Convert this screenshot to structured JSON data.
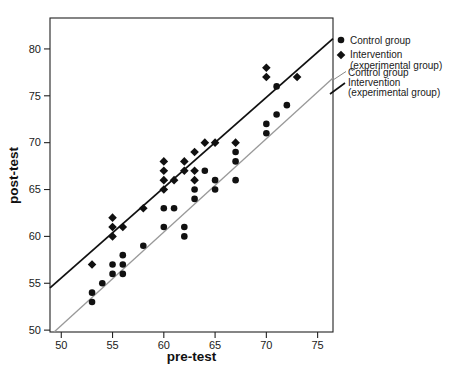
{
  "chart_data": {
    "type": "scatter",
    "title": "",
    "xlabel": "pre-test",
    "ylabel": "post-test",
    "xlim": [
      48.9,
      76.5
    ],
    "ylim": [
      49.8,
      83.3
    ],
    "x_ticks": [
      50,
      55,
      60,
      65,
      70,
      75
    ],
    "y_ticks": [
      50,
      55,
      60,
      65,
      70,
      75,
      80
    ],
    "grid": false,
    "legend_position": "right-outside",
    "colors": {
      "marker": "#111111",
      "control_line": "#999999",
      "intervention_line": "#111111",
      "spine": "#222222"
    },
    "series": [
      {
        "name": "Control group",
        "marker": "circle",
        "color": "#111111",
        "points": [
          [
            53,
            53
          ],
          [
            53,
            54
          ],
          [
            54,
            55
          ],
          [
            55,
            56
          ],
          [
            55,
            57
          ],
          [
            56,
            56
          ],
          [
            56,
            57
          ],
          [
            56,
            58
          ],
          [
            58,
            59
          ],
          [
            60,
            61
          ],
          [
            60,
            63
          ],
          [
            61,
            63
          ],
          [
            62,
            60
          ],
          [
            62,
            61
          ],
          [
            63,
            64
          ],
          [
            63,
            65
          ],
          [
            64,
            67
          ],
          [
            65,
            65
          ],
          [
            65,
            66
          ],
          [
            67,
            66
          ],
          [
            67,
            68
          ],
          [
            67,
            69
          ],
          [
            70,
            71
          ],
          [
            70,
            72
          ],
          [
            71,
            73
          ],
          [
            71,
            76
          ],
          [
            72,
            74
          ]
        ]
      },
      {
        "name": "Intervention (experimental group)",
        "marker": "diamond",
        "color": "#111111",
        "points": [
          [
            53,
            57
          ],
          [
            55,
            60
          ],
          [
            55,
            61
          ],
          [
            55,
            62
          ],
          [
            56,
            61
          ],
          [
            58,
            63
          ],
          [
            60,
            65
          ],
          [
            60,
            66
          ],
          [
            60,
            67
          ],
          [
            60,
            68
          ],
          [
            61,
            66
          ],
          [
            62,
            67
          ],
          [
            62,
            68
          ],
          [
            63,
            66
          ],
          [
            63,
            67
          ],
          [
            63,
            69
          ],
          [
            64,
            70
          ],
          [
            65,
            70
          ],
          [
            67,
            70
          ],
          [
            70,
            77
          ],
          [
            70,
            78
          ],
          [
            73,
            77
          ]
        ]
      }
    ],
    "fit_lines": [
      {
        "name": "Control group",
        "style": "thin-gray",
        "color": "#999999",
        "width": 1.3,
        "from": [
          49.3,
          49.8
        ],
        "to": [
          76.5,
          76.9
        ]
      },
      {
        "name": "Intervention (experimental group)",
        "style": "thick-black",
        "color": "#111111",
        "width": 1.8,
        "from": [
          48.9,
          54.5
        ],
        "to": [
          76.5,
          81.1
        ]
      }
    ],
    "legend": [
      {
        "kind": "marker",
        "marker": "circle",
        "label": "Control group",
        "label2": ""
      },
      {
        "kind": "marker",
        "marker": "diamond",
        "label": "Intervention",
        "label2": "(experimental group)"
      },
      {
        "kind": "line",
        "style": "thin-gray",
        "label": "Control group",
        "label2": ""
      },
      {
        "kind": "line",
        "style": "thick-black",
        "label": "Intervention",
        "label2": "(experimental group)"
      }
    ]
  }
}
